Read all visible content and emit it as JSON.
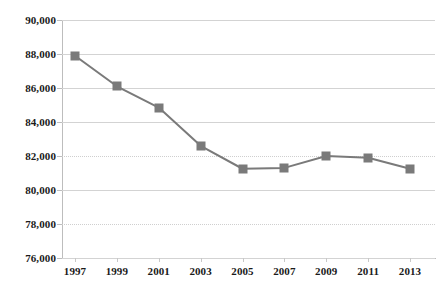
{
  "chart_data": {
    "type": "line",
    "title": "",
    "subtitle": "",
    "xlabel": "",
    "ylabel": "",
    "categories": [
      "1997",
      "1999",
      "2001",
      "2003",
      "2005",
      "2007",
      "2009",
      "2011",
      "2013"
    ],
    "values": [
      87900,
      86100,
      84850,
      82600,
      81250,
      81300,
      82000,
      81900,
      81250
    ],
    "series": [
      {
        "name": "",
        "values": [
          87900,
          86100,
          84850,
          82600,
          81250,
          81300,
          82000,
          81900,
          81250
        ]
      }
    ],
    "ylim": [
      76000,
      90000
    ],
    "ytick_values": [
      90000,
      88000,
      86000,
      84000,
      82000,
      80000,
      78000,
      76000
    ],
    "ytick_labels": [
      "90,000",
      "88,000",
      "86,000",
      "84,000",
      "82,000",
      "80,000",
      "78,000",
      "76,000"
    ],
    "xtick_labels": [
      "1997",
      "1999",
      "2001",
      "2003",
      "2005",
      "2007",
      "2009",
      "2011",
      "2013"
    ],
    "grid": true,
    "grid_axis": "y",
    "legend": false,
    "legend_position": "none",
    "annotations": [],
    "colors": {
      "line": "#7a7a7a",
      "marker": "#7a7a7a",
      "gridline": "#d3d3d3",
      "axis": "#bdbdbd",
      "background": "#ffffff",
      "tick_label": "#1a1a1a"
    },
    "marker_style": "square",
    "line_width": 2
  }
}
